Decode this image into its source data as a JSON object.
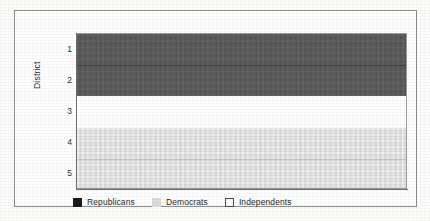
{
  "chart_data": {
    "type": "area",
    "title": "",
    "subtitle": "",
    "orientation": "horizontal-bands",
    "xlabel": "",
    "ylabel": "District",
    "ylim": [
      0.5,
      5.5
    ],
    "y_ticks": [
      "1",
      "2",
      "3",
      "4",
      "5"
    ],
    "y_tick_values": [
      1,
      2,
      3,
      4,
      5
    ],
    "x_ticks": [],
    "grid": true,
    "gridlines_at": [
      1.5,
      4.5
    ],
    "legend_position": "bottom-left",
    "categories": [
      "1",
      "2",
      "3",
      "4",
      "5"
    ],
    "series": [
      {
        "name": "Republicans",
        "color": "#5b5b5b",
        "legend_swatch_color": "#1b1b1b",
        "band_start": 0.5,
        "band_end": 2.5,
        "districts": [
          "1",
          "2"
        ]
      },
      {
        "name": "Independents",
        "color": "#ffffff",
        "legend_swatch_color": "#ffffff",
        "band_start": 2.5,
        "band_end": 3.5,
        "districts": [
          "3"
        ]
      },
      {
        "name": "Democrats",
        "color": "#e3e3e3",
        "legend_swatch_color": "#dcdcdc",
        "band_start": 3.5,
        "band_end": 5.5,
        "districts": [
          "4",
          "5"
        ]
      }
    ],
    "values": [
      {
        "district": 1,
        "party": "Republicans"
      },
      {
        "district": 2,
        "party": "Republicans"
      },
      {
        "district": 3,
        "party": "Independents"
      },
      {
        "district": 4,
        "party": "Democrats"
      },
      {
        "district": 5,
        "party": "Democrats"
      }
    ]
  },
  "axis": {
    "y_title": "District",
    "ticks": [
      {
        "label": "1"
      },
      {
        "label": "2"
      },
      {
        "label": "3"
      },
      {
        "label": "4"
      },
      {
        "label": "5"
      }
    ]
  },
  "legend": {
    "items": [
      {
        "label": "Republicans",
        "swatch": "republicans-swatch"
      },
      {
        "label": "Democrats",
        "swatch": "democrats-swatch"
      },
      {
        "label": "Independents",
        "swatch": "independents-swatch"
      }
    ]
  },
  "colors": {
    "republicans_band": "#5b5b5b",
    "democrats_band": "#e3e3e3",
    "independents_band": "#ffffff",
    "frame_border": "#8e8e8e",
    "axis_line": "#6f6f6f",
    "text": "#2f2f2f",
    "page_background": "#fdfdfc"
  }
}
